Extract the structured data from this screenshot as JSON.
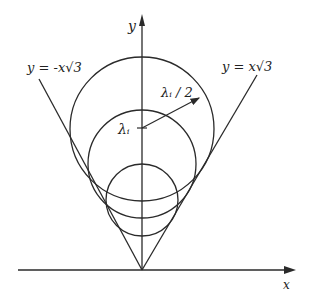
{
  "diagram": {
    "axes": {
      "x_label": "x",
      "y_label": "y"
    },
    "lines": {
      "left_label": "y = -x√3",
      "right_label": "y = x√3"
    },
    "annotations": {
      "center_label": "λᵢ",
      "radius_label": "λᵢ / 2"
    },
    "circles": [
      {
        "name": "large",
        "cy": 129,
        "r": 72
      },
      {
        "name": "middle",
        "cy": 164,
        "r": 54
      },
      {
        "name": "small",
        "cy": 200,
        "r": 36
      }
    ],
    "colors": {
      "ink": "#2a2a2a",
      "background": "#ffffff"
    }
  }
}
